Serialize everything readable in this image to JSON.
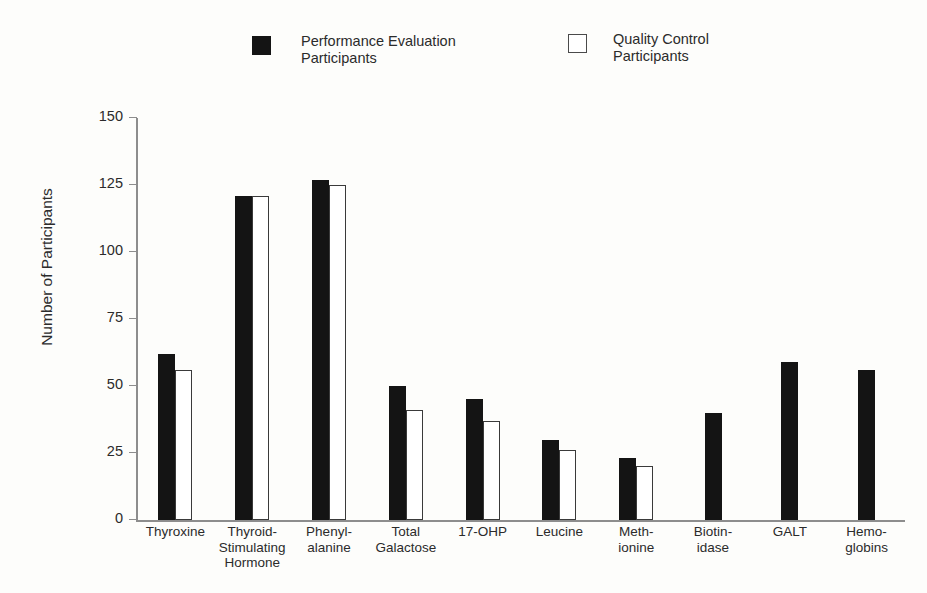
{
  "legend": {
    "entries": [
      {
        "key": "pe",
        "label": "Performance Evaluation\nParticipants",
        "swatch": "filled-square",
        "color": "#141414"
      },
      {
        "key": "qc",
        "label": "Quality Control\nParticipants",
        "swatch": "open-square",
        "color": "#ffffff"
      }
    ]
  },
  "axes": {
    "ylabel": "Number of Participants",
    "yticks": [
      "0",
      "25",
      "50",
      "75",
      "100",
      "125",
      "150"
    ]
  },
  "chart_data": {
    "type": "bar",
    "title": "",
    "xlabel": "",
    "ylabel": "Number of Participants",
    "ylim": [
      0,
      150
    ],
    "ytick_values": [
      0,
      25,
      50,
      75,
      100,
      125,
      150
    ],
    "grid": false,
    "legend_position": "top",
    "categories": [
      "Thyroxine",
      "Thyroid-\nStimulating\nHormone",
      "Phenyl-\nalanine",
      "Total\nGalactose",
      "17-OHP",
      "Leucine",
      "Meth-\nionine",
      "Biotin-\nidase",
      "GALT",
      "Hemo-\nglobins"
    ],
    "series": [
      {
        "name": "Performance Evaluation Participants",
        "color": "#141414",
        "values": [
          62,
          121,
          127,
          50,
          45,
          30,
          23,
          40,
          59,
          56
        ]
      },
      {
        "name": "Quality Control Participants",
        "color": "#ffffff",
        "values": [
          56,
          121,
          125,
          41,
          37,
          26,
          20,
          null,
          null,
          null
        ]
      }
    ]
  }
}
